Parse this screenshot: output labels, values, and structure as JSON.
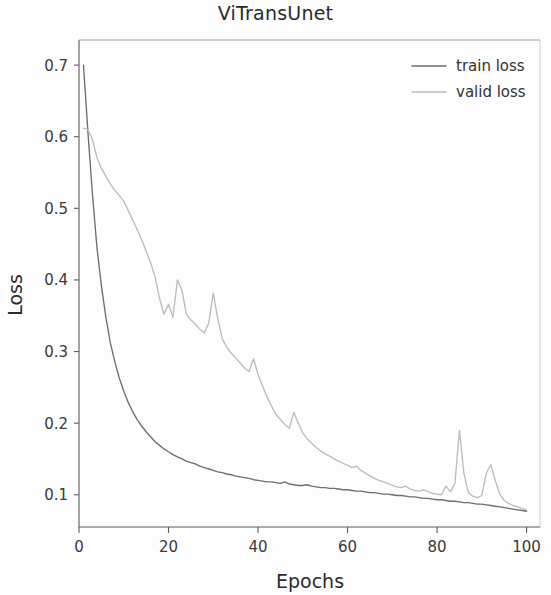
{
  "chart_data": {
    "type": "line",
    "title": "ViTransUnet",
    "xlabel": "Epochs",
    "ylabel": "Loss",
    "xlim": [
      0,
      103
    ],
    "ylim": [
      0.055,
      0.735
    ],
    "xticks": [
      0,
      20,
      40,
      60,
      80,
      100
    ],
    "xtick_labels": [
      "0",
      "20",
      "40",
      "60",
      "80",
      "100"
    ],
    "yticks": [
      0.1,
      0.2,
      0.3,
      0.4,
      0.5,
      0.6,
      0.7
    ],
    "ytick_labels": [
      "0.1",
      "0.2",
      "0.3",
      "0.4",
      "0.5",
      "0.6",
      "0.7"
    ],
    "grid": false,
    "legend_position": "upper right",
    "colors": {
      "train_loss": "#6e6e6e",
      "valid_loss": "#bcbcbc",
      "axis": "#5c5c5c",
      "text": "#2b2b2b",
      "background": "#fdfdfd"
    },
    "series": [
      {
        "name": "train loss",
        "color": "#6e6e6e",
        "x": [
          1,
          2,
          3,
          4,
          5,
          6,
          7,
          8,
          9,
          10,
          11,
          12,
          13,
          14,
          15,
          16,
          17,
          18,
          19,
          20,
          21,
          22,
          23,
          24,
          25,
          26,
          27,
          28,
          29,
          30,
          31,
          32,
          33,
          34,
          35,
          36,
          37,
          38,
          39,
          40,
          41,
          42,
          43,
          44,
          45,
          46,
          47,
          48,
          49,
          50,
          51,
          52,
          53,
          54,
          55,
          56,
          57,
          58,
          59,
          60,
          61,
          62,
          63,
          64,
          65,
          66,
          67,
          68,
          69,
          70,
          71,
          72,
          73,
          74,
          75,
          76,
          77,
          78,
          79,
          80,
          81,
          82,
          83,
          84,
          85,
          86,
          87,
          88,
          89,
          90,
          91,
          92,
          93,
          94,
          95,
          96,
          97,
          98,
          99,
          100
        ],
        "y": [
          0.7,
          0.606,
          0.52,
          0.446,
          0.392,
          0.348,
          0.312,
          0.286,
          0.263,
          0.245,
          0.229,
          0.216,
          0.205,
          0.196,
          0.188,
          0.181,
          0.174,
          0.169,
          0.164,
          0.16,
          0.156,
          0.153,
          0.15,
          0.147,
          0.145,
          0.143,
          0.14,
          0.138,
          0.136,
          0.134,
          0.132,
          0.131,
          0.129,
          0.128,
          0.126,
          0.125,
          0.124,
          0.123,
          0.121,
          0.12,
          0.119,
          0.118,
          0.118,
          0.117,
          0.116,
          0.118,
          0.115,
          0.114,
          0.113,
          0.113,
          0.114,
          0.112,
          0.111,
          0.11,
          0.11,
          0.109,
          0.109,
          0.108,
          0.107,
          0.107,
          0.106,
          0.105,
          0.105,
          0.104,
          0.103,
          0.103,
          0.102,
          0.101,
          0.101,
          0.1,
          0.099,
          0.099,
          0.098,
          0.097,
          0.097,
          0.096,
          0.095,
          0.095,
          0.094,
          0.093,
          0.093,
          0.092,
          0.091,
          0.091,
          0.09,
          0.089,
          0.089,
          0.088,
          0.087,
          0.087,
          0.086,
          0.085,
          0.084,
          0.083,
          0.082,
          0.081,
          0.08,
          0.079,
          0.078,
          0.077
        ]
      },
      {
        "name": "valid loss",
        "color": "#bcbcbc",
        "x": [
          1,
          2,
          3,
          4,
          5,
          6,
          7,
          8,
          9,
          10,
          11,
          12,
          13,
          14,
          15,
          16,
          17,
          18,
          19,
          20,
          21,
          22,
          23,
          24,
          25,
          26,
          27,
          28,
          29,
          30,
          31,
          32,
          33,
          34,
          35,
          36,
          37,
          38,
          39,
          40,
          41,
          42,
          43,
          44,
          45,
          46,
          47,
          48,
          49,
          50,
          51,
          52,
          53,
          54,
          55,
          56,
          57,
          58,
          59,
          60,
          61,
          62,
          63,
          64,
          65,
          66,
          67,
          68,
          69,
          70,
          71,
          72,
          73,
          74,
          75,
          76,
          77,
          78,
          79,
          80,
          81,
          82,
          83,
          84,
          85,
          86,
          87,
          88,
          89,
          90,
          91,
          92,
          93,
          94,
          95,
          96,
          97,
          98,
          99,
          100
        ],
        "y": [
          0.612,
          0.61,
          0.596,
          0.571,
          0.556,
          0.545,
          0.534,
          0.525,
          0.518,
          0.51,
          0.497,
          0.484,
          0.47,
          0.456,
          0.44,
          0.424,
          0.404,
          0.374,
          0.352,
          0.366,
          0.348,
          0.4,
          0.386,
          0.352,
          0.344,
          0.338,
          0.331,
          0.326,
          0.34,
          0.382,
          0.346,
          0.318,
          0.306,
          0.298,
          0.291,
          0.284,
          0.277,
          0.272,
          0.29,
          0.268,
          0.252,
          0.237,
          0.224,
          0.212,
          0.205,
          0.198,
          0.193,
          0.215,
          0.2,
          0.186,
          0.178,
          0.172,
          0.166,
          0.161,
          0.157,
          0.154,
          0.15,
          0.147,
          0.144,
          0.141,
          0.138,
          0.14,
          0.134,
          0.13,
          0.126,
          0.123,
          0.12,
          0.118,
          0.116,
          0.113,
          0.111,
          0.11,
          0.112,
          0.108,
          0.106,
          0.105,
          0.107,
          0.104,
          0.102,
          0.101,
          0.1,
          0.112,
          0.104,
          0.116,
          0.19,
          0.13,
          0.103,
          0.098,
          0.096,
          0.099,
          0.13,
          0.142,
          0.12,
          0.101,
          0.092,
          0.088,
          0.085,
          0.083,
          0.081,
          0.079
        ]
      }
    ],
    "annotations": [
      {
        "text": "valid loss spike",
        "epoch": 85,
        "value": 0.19
      }
    ]
  },
  "legend": {
    "entries": [
      {
        "label": "train loss"
      },
      {
        "label": "valid loss"
      }
    ]
  }
}
